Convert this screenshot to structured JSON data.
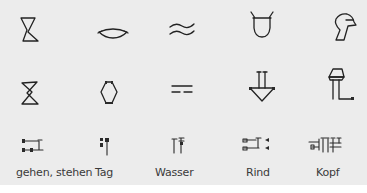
{
  "figure": {
    "rows": [
      "pictograph",
      "rotated-pictograph",
      "cuneiform"
    ],
    "columns": [
      {
        "id": "gehen",
        "label": "gehen, stehen",
        "icons": [
          "foot-pictograph-icon",
          "foot-rotated-icon",
          "foot-cuneiform-icon"
        ]
      },
      {
        "id": "tag",
        "label": "Tag",
        "icons": [
          "sun-pictograph-icon",
          "sun-rotated-icon",
          "sun-cuneiform-icon"
        ]
      },
      {
        "id": "wasser",
        "label": "Wasser",
        "icons": [
          "water-pictograph-icon",
          "water-rotated-icon",
          "water-cuneiform-icon"
        ]
      },
      {
        "id": "rind",
        "label": "Rind",
        "icons": [
          "ox-head-pictograph-icon",
          "ox-head-rotated-icon",
          "ox-cuneiform-icon"
        ]
      },
      {
        "id": "kopf",
        "label": "Kopf",
        "icons": [
          "head-pictograph-icon",
          "head-rotated-icon",
          "head-cuneiform-icon"
        ]
      }
    ]
  },
  "colors": {
    "background": "#ececec",
    "ink": "#222222",
    "label": "#3a3a3a"
  }
}
